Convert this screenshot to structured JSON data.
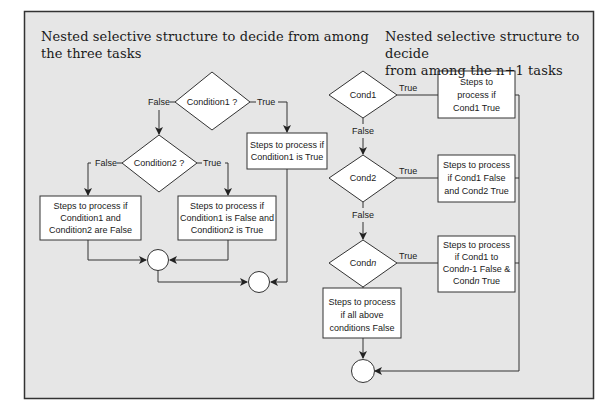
{
  "colors": {
    "panel_bg": "#e6e6e6",
    "border": "#333333",
    "shape_fill": "#ffffff",
    "line": "#333333",
    "text": "#1a1a1a"
  },
  "left": {
    "title_line1": "Nested selective structure to decide from among",
    "title_line2": "the three tasks",
    "decision1": "Condition1 ?",
    "decision2": "Condition2 ?",
    "false_label": "False",
    "true_label": "True",
    "box_c1_true": [
      "Steps to process if",
      "Condition1 is True"
    ],
    "box_c1c2_false": [
      "Steps to process if",
      "Condition1 and",
      "Condition2 are False"
    ],
    "box_c1_false_c2_true": [
      "Steps to process if",
      "Condition1 is False and",
      "Condition2 is True"
    ]
  },
  "right": {
    "title_line1": "Nested selective structure to decide",
    "title_line2": "from among the n+1 tasks",
    "cond1": "Cond1",
    "cond2": "Cond2",
    "condn_prefix": "Cond",
    "condn_italic": "n",
    "true_label": "True",
    "false_label": "False",
    "box1": [
      "Steps to",
      "process if",
      "Cond1 True"
    ],
    "box2": [
      "Steps to process",
      "if Cond1 False",
      "and Cond2 True"
    ],
    "boxn_line1": "Steps to process",
    "boxn_line2": "if Cond1 to",
    "boxn_line3_a": "Cond",
    "boxn_line3_n": "n",
    "boxn_line3_b": "-1 False &",
    "boxn_line4_a": "Cond",
    "boxn_line4_n": "n",
    "boxn_line4_b": " True",
    "box_else": [
      "Steps to process",
      "if all above",
      "conditions False"
    ]
  }
}
